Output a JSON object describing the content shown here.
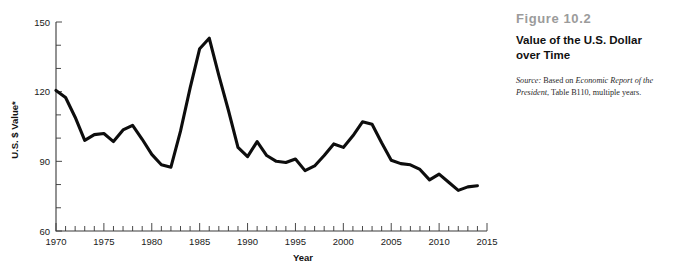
{
  "figure": {
    "number": "Figure 10.2",
    "title_line1": "Value of the U.S. Dollar",
    "title_line2": "over Time",
    "source_label": "Source:",
    "source_text_1": " Based on ",
    "source_italic_1": "Economic Report of the President",
    "source_text_2": ", Table B110, multiple years."
  },
  "colors": {
    "line": "#0d0d0d",
    "axis": "#3a3a3a",
    "figure_number": "#9b9b9b",
    "background": "#ffffff",
    "text": "#111111"
  },
  "chart_data": {
    "type": "line",
    "title": "Value of the U.S. Dollar over Time",
    "xlabel": "Year",
    "ylabel": "U.S. $ Value*",
    "xlim": [
      1970,
      2015
    ],
    "ylim": [
      60,
      150
    ],
    "ytick_labels": [
      "60",
      "90",
      "120",
      "150"
    ],
    "yticks": [
      60,
      90,
      120,
      150
    ],
    "yminor_step": 10,
    "xtick_labels": [
      "1970",
      "1975",
      "1980",
      "1985",
      "1990",
      "1995",
      "2000",
      "2005",
      "2010",
      "2015"
    ],
    "xticks": [
      1970,
      1975,
      1980,
      1985,
      1990,
      1995,
      2000,
      2005,
      2010,
      2015
    ],
    "xminor_step": 1,
    "grid": false,
    "legend": false,
    "series": [
      {
        "name": "U.S. $ Value",
        "x": [
          1970,
          1971,
          1972,
          1973,
          1974,
          1975,
          1976,
          1977,
          1978,
          1979,
          1980,
          1981,
          1982,
          1983,
          1984,
          1985,
          1986,
          1987,
          1988,
          1989,
          1990,
          1991,
          1992,
          1993,
          1994,
          1995,
          1996,
          1997,
          1998,
          1999,
          2000,
          2001,
          2002,
          2003,
          2004,
          2005,
          2006,
          2007,
          2008,
          2009,
          2010,
          2011,
          2012,
          2013,
          2014
        ],
        "values": [
          120.5,
          117.5,
          109.0,
          99.0,
          101.5,
          102.0,
          98.5,
          103.5,
          105.5,
          99.5,
          93.0,
          88.5,
          87.5,
          103.0,
          121.5,
          138.5,
          143.0,
          127.0,
          112.0,
          96.0,
          92.0,
          98.5,
          92.5,
          90.0,
          89.5,
          91.0,
          86.0,
          88.0,
          92.5,
          97.5,
          96.0,
          101.0,
          107.0,
          106.0,
          98.0,
          90.5,
          89.0,
          88.5,
          86.5,
          82.0,
          84.5,
          81.0,
          77.5,
          79.0,
          79.5
        ]
      }
    ]
  }
}
